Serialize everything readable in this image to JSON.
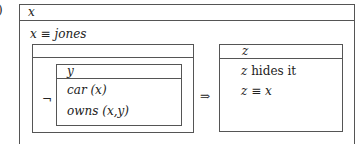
{
  "label": "(a)",
  "outer": {
    "referent": "x",
    "conditions": [
      "x ≡ jones"
    ]
  },
  "antecedent": {
    "referent": "",
    "negation_symbol": "¬",
    "inner": {
      "referent": "y",
      "conditions": [
        "car (x)",
        "owns (x,y)"
      ]
    }
  },
  "implication_symbol": "⇒",
  "consequent": {
    "referent": "z",
    "conditions": [
      "z hides it",
      "z ≡ x"
    ]
  }
}
